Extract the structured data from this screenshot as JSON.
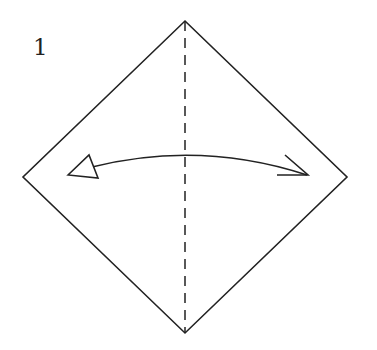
{
  "diagram": {
    "type": "origami-step",
    "step_number": "1",
    "square": {
      "vertices": {
        "top": [
          185,
          21
        ],
        "right": [
          347,
          177
        ],
        "bottom": [
          185,
          333
        ],
        "left": [
          23,
          177
        ]
      }
    },
    "fold_line": {
      "style": "dashed",
      "kind": "valley-fold",
      "orientation": "vertical"
    },
    "arrow": {
      "kind": "fold-and-unfold",
      "from": "right",
      "to": "left"
    },
    "colors": {
      "line": "#222222",
      "background": "#ffffff"
    }
  }
}
